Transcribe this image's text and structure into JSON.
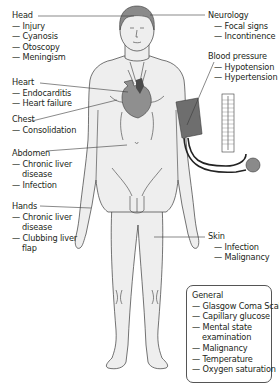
{
  "diagram": {
    "type": "medical-examination-body-map",
    "colors": {
      "skin": "#eeeeee",
      "outline": "#3a3a3a",
      "hair": "#8a8a8a",
      "heart": "#8f8f8f",
      "heart_dark": "#4a4a4a",
      "cuff": "#6e6e6e",
      "bulb": "#8a8a8a",
      "text": "#231f20"
    }
  },
  "labels": {
    "head": {
      "title": "Head",
      "items": [
        "— Injury",
        "— Cyanosis",
        "— Otoscopy",
        "— Meningism"
      ]
    },
    "heart": {
      "title": "Heart",
      "items": [
        "— Endocarditis",
        "— Heart failure"
      ]
    },
    "chest": {
      "title": "Chest",
      "items": [
        "— Consolidation"
      ]
    },
    "abdomen": {
      "title": "Abdomen",
      "items": [
        "— Chronic liver",
        "disease",
        "— Infection"
      ]
    },
    "hands": {
      "title": "Hands",
      "items": [
        "— Chronic liver",
        "disease",
        "— Clubbing liver",
        "flap"
      ]
    },
    "neurology": {
      "title": "Neurology",
      "items": [
        "— Focal signs",
        "— Incontinence"
      ]
    },
    "blood_pressure": {
      "title": "Blood pressure",
      "items": [
        "— Hypotension",
        "— Hypertension"
      ]
    },
    "skin": {
      "title": "Skin",
      "items": [
        "— Infection",
        "— Malignancy"
      ]
    },
    "general": {
      "title": "General",
      "items": [
        "— Glasgow Coma Scale",
        "— Capillary glucose",
        "— Mental state",
        "examination",
        "— Malignancy",
        "— Temperature",
        "— Oxygen saturation"
      ]
    }
  }
}
